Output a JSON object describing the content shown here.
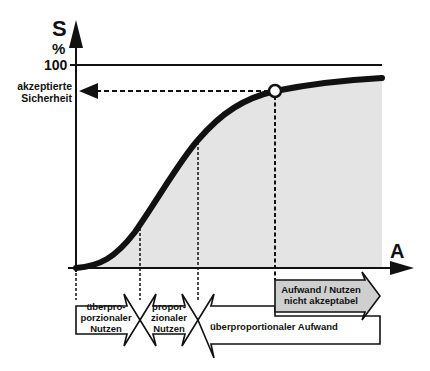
{
  "diagram": {
    "y_axis": {
      "symbol": "S",
      "unit": "%",
      "tick_100": "100"
    },
    "x_axis": {
      "symbol": "A"
    },
    "accepted_level": {
      "line1": "akzeptierte",
      "line2": "Sicherheit"
    },
    "phases": [
      {
        "id": "overproportional-benefit",
        "lines": [
          "überpro-",
          "porzionaler",
          "Nutzen"
        ]
      },
      {
        "id": "proportional-benefit",
        "lines": [
          "propor-",
          "zionaler",
          "Nutzen"
        ]
      },
      {
        "id": "overproportional-effort",
        "lines": [
          "überproportionaler Aufwand"
        ]
      }
    ],
    "unacceptable": {
      "line1": "Aufwand / Nutzen",
      "line2": "nicht akzeptabel"
    },
    "colors": {
      "stroke": "#111111",
      "fill_area": "#e4e4e4",
      "gray_arrow": "#cfcfcf",
      "background": "#ffffff"
    }
  }
}
